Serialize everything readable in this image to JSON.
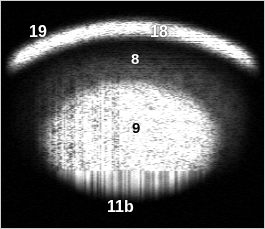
{
  "image": {
    "modality": "ultrasound",
    "kind": "grayscale-b-mode-sonogram",
    "width": 265,
    "height": 229,
    "background_color": "#000000",
    "border_color": "#cfcfcf",
    "alt": "Grayscale B-mode ultrasound scan with a bright curved superficial band and a large hyperechoic oval mass in the center, annotated with numbered labels"
  },
  "annotations": [
    {
      "id": "label-19",
      "text": "19",
      "color": "#ffffff",
      "tone": "light",
      "x": 29,
      "y": 24,
      "font_size": 16,
      "region": "upper-left superficial layer"
    },
    {
      "id": "label-18",
      "text": "18",
      "color": "#ffffff",
      "tone": "light",
      "x": 150,
      "y": 24,
      "font_size": 16,
      "region": "upper-central superficial layer"
    },
    {
      "id": "label-8",
      "text": "8",
      "color": "#ffffff",
      "tone": "light",
      "x": 131,
      "y": 51,
      "font_size": 15,
      "region": "subcutaneous band above mass"
    },
    {
      "id": "label-9",
      "text": "9",
      "color": "#000000",
      "tone": "dark",
      "x": 132,
      "y": 120,
      "font_size": 15,
      "region": "center of hyperechoic mass"
    },
    {
      "id": "label-11b",
      "text": "11b",
      "color": "#ffffff",
      "tone": "light",
      "x": 107,
      "y": 199,
      "font_size": 16,
      "region": "deep acoustic shadow below mass"
    }
  ],
  "structures": {
    "superficial_arc": {
      "name": "bright curved superficial band",
      "brightness": "high",
      "center_x": 132,
      "center_y": 255,
      "radius": 228,
      "thickness": 14
    },
    "central_mass": {
      "name": "hyperechoic oval mass",
      "brightness": "high",
      "center_x": 130,
      "center_y": 140,
      "radius_x": 92,
      "radius_y": 62
    },
    "mid_layer": {
      "name": "intermediate echogenic tissue layer",
      "brightness": "medium",
      "center_x": 132,
      "center_y": 118,
      "radius_x": 128,
      "radius_y": 78
    },
    "deep_shadow": {
      "name": "posterior dark region",
      "brightness": "low",
      "top": 190
    }
  },
  "render": {
    "speckle_seed": 20240517,
    "speckle_cells_x": 178,
    "speckle_cells_y": 154,
    "noise_strength": 0.55
  }
}
